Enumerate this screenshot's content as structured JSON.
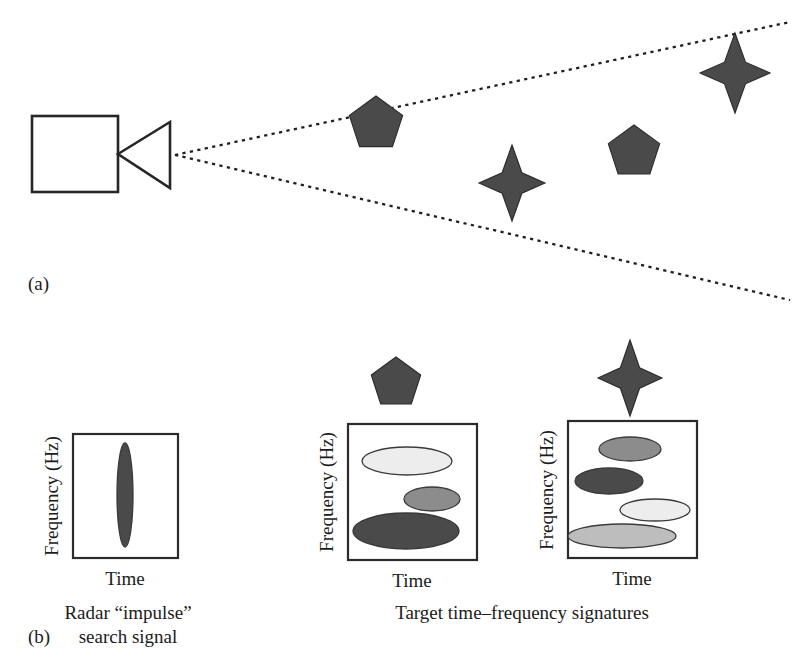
{
  "figure": {
    "title_parts": {
      "part_a_label": "(a)",
      "part_b_label": "(b)"
    },
    "captions": {
      "left_line1": "Radar “impulse”",
      "left_line2": "search signal",
      "right": "Target time–frequency signatures"
    },
    "axis_labels": {
      "y": "Frequency (Hz)",
      "x": "Time"
    },
    "colors": {
      "outline": "#262626",
      "target_fill": "#4a4a4a",
      "blob_dark": "#4a4a4a",
      "blob_mid": "#8c8c8c",
      "blob_light": "#ededed",
      "blob_light_mid": "#bdbdbd",
      "background": "#ffffff"
    }
  },
  "scene_a": {
    "radar": {
      "name": "radar transmitter",
      "box": {
        "x": 32,
        "y": 116,
        "w": 86,
        "h": 76
      },
      "horn": {
        "apex_x": 118,
        "apex_y": 154,
        "back_x": 170,
        "top_y": 122,
        "bottom_y": 188
      }
    },
    "beam": {
      "apex": {
        "x": 175,
        "y": 155
      },
      "upper_end": {
        "x": 790,
        "y": 22
      },
      "lower_end": {
        "x": 790,
        "y": 300
      }
    },
    "targets": [
      {
        "name": "pentagon-upper-left",
        "shape": "pentagon",
        "cx": 376,
        "cy": 124,
        "r": 28,
        "fill": "#4a4a4a"
      },
      {
        "name": "star-lower-middle",
        "shape": "star4",
        "cx": 512,
        "cy": 183,
        "rx": 33,
        "ry": 38,
        "fill": "#4a4a4a"
      },
      {
        "name": "pentagon-middle-right",
        "shape": "pentagon",
        "cx": 634,
        "cy": 152,
        "r": 27,
        "fill": "#4a4a4a"
      },
      {
        "name": "star-upper-right",
        "shape": "star4",
        "cx": 735,
        "cy": 73,
        "rx": 35,
        "ry": 40,
        "fill": "#4a4a4a"
      }
    ]
  },
  "scene_b": {
    "panels": [
      {
        "name": "radar-impulse-spectrogram",
        "box": {
          "x": 73,
          "y": 434,
          "w": 105,
          "h": 124
        },
        "icon": null,
        "blobs": [
          {
            "name": "impulse-blob",
            "cx": 125,
            "cy": 495,
            "rx": 8,
            "ry": 52,
            "fill": "#4a4a4a"
          }
        ]
      },
      {
        "name": "pentagon-target-spectrogram",
        "box": {
          "x": 348,
          "y": 424,
          "w": 129,
          "h": 136
        },
        "icon": {
          "shape": "pentagon",
          "cx": 396,
          "cy": 383,
          "r": 26,
          "fill": "#4a4a4a"
        },
        "blobs": [
          {
            "name": "blob-high-light",
            "cx": 407,
            "cy": 461,
            "rx": 45,
            "ry": 14,
            "fill": "#ededed"
          },
          {
            "name": "blob-mid-gray",
            "cx": 432,
            "cy": 499,
            "rx": 28,
            "ry": 12,
            "fill": "#8c8c8c"
          },
          {
            "name": "blob-low-dark",
            "cx": 406,
            "cy": 531,
            "rx": 53,
            "ry": 18,
            "fill": "#4a4a4a"
          }
        ]
      },
      {
        "name": "star-target-spectrogram",
        "box": {
          "x": 568,
          "y": 421,
          "w": 129,
          "h": 137
        },
        "icon": {
          "shape": "star4",
          "cx": 630,
          "cy": 378,
          "rx": 32,
          "ry": 38,
          "fill": "#4a4a4a"
        },
        "blobs": [
          {
            "name": "blob-high-mid",
            "cx": 630,
            "cy": 449,
            "rx": 31,
            "ry": 12,
            "fill": "#8c8c8c"
          },
          {
            "name": "blob-upper-dark",
            "cx": 609,
            "cy": 481,
            "rx": 34,
            "ry": 13,
            "fill": "#4a4a4a"
          },
          {
            "name": "blob-lower-light",
            "cx": 655,
            "cy": 510,
            "rx": 35,
            "ry": 11,
            "fill": "#ededed"
          },
          {
            "name": "blob-bottom-lightmid",
            "cx": 622,
            "cy": 536,
            "rx": 54,
            "ry": 12,
            "fill": "#bdbdbd"
          }
        ]
      }
    ]
  }
}
